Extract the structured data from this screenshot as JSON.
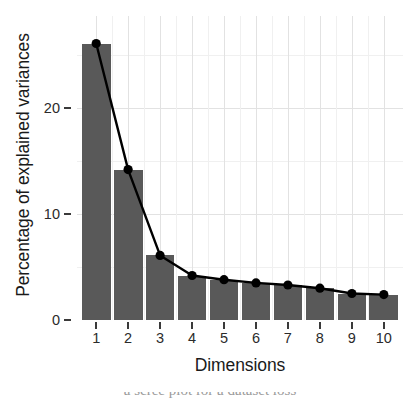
{
  "chart_data": {
    "type": "bar",
    "title": "",
    "subtitle": "",
    "xlabel": "Dimensions",
    "ylabel": "Percentage of explained variances",
    "categories": [
      "1",
      "2",
      "3",
      "4",
      "5",
      "6",
      "7",
      "8",
      "9",
      "10"
    ],
    "values": [
      26.1,
      14.2,
      6.1,
      4.2,
      3.8,
      3.5,
      3.3,
      3.0,
      2.5,
      2.4
    ],
    "series": [
      {
        "name": "Percentage of explained variances",
        "values": [
          26.1,
          14.2,
          6.1,
          4.2,
          3.8,
          3.5,
          3.3,
          3.0,
          2.5,
          2.4
        ]
      }
    ],
    "ylim": [
      0,
      28.7
    ],
    "xlim": [
      0.4,
      10.6
    ],
    "ytick_labels": [
      "0",
      "10",
      "20"
    ],
    "ytick_values": [
      0,
      10,
      20
    ],
    "y_minor_gridlines": [
      5,
      15,
      25
    ],
    "xtick_labels": [
      "1",
      "2",
      "3",
      "4",
      "5",
      "6",
      "7",
      "8",
      "9",
      "10"
    ],
    "grid": true,
    "legend": "none",
    "bar_color": "#595959",
    "line_color": "#000000",
    "point_color": "#000000",
    "panel_background": "#ffffff",
    "grid_color": "#e2e2e2",
    "grid_minor_color": "#f0f0f0",
    "annotations": []
  },
  "axes": {
    "y_title": "Percentage of explained variances",
    "x_title": "Dimensions"
  },
  "caption": {
    "cropped_text": "a scree plot for a dataset loss"
  }
}
